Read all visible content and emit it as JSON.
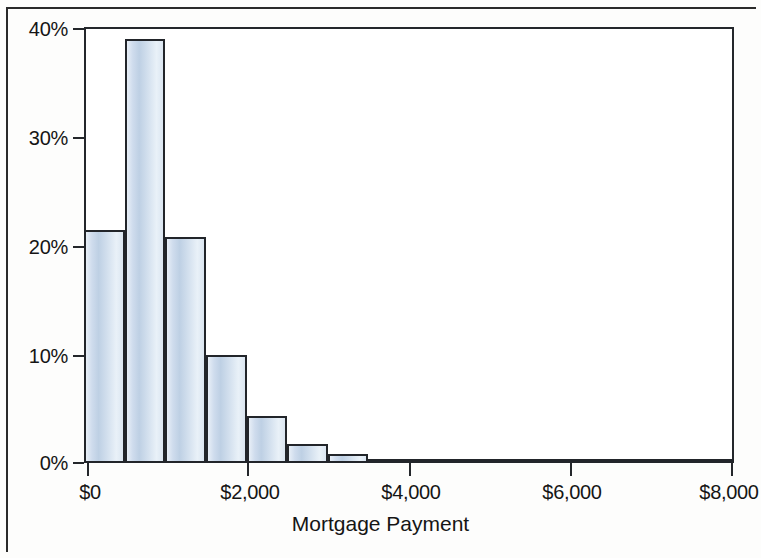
{
  "chart_data": {
    "type": "bar",
    "title": "",
    "subtitle": "",
    "xlabel": "Mortgage Payment",
    "ylabel": "",
    "xlim": [
      0,
      8000
    ],
    "ylim": [
      0,
      40
    ],
    "grid": false,
    "legend": null,
    "x_tick_labels": [
      "$0",
      "$2,000",
      "$4,000",
      "$6,000",
      "$8,000"
    ],
    "x_tick_values": [
      0,
      2000,
      4000,
      6000,
      8000
    ],
    "y_tick_labels": [
      "0%",
      "10%",
      "20%",
      "30%",
      "40%"
    ],
    "y_tick_values": [
      0,
      10,
      20,
      30,
      40
    ],
    "bin_width": 500,
    "bin_starts": [
      0,
      500,
      1000,
      1500,
      2000,
      2500,
      3000,
      3500,
      4000,
      4500,
      5000,
      5500,
      6000,
      6500,
      7000,
      7500
    ],
    "categories": [
      "$0–$500",
      "$500–$1,000",
      "$1,000–$1,500",
      "$1,500–$2,000",
      "$2,000–$2,500",
      "$2,500–$3,000",
      "$3,000–$3,500",
      "$3,500–$4,000",
      "$4,000–$4,500",
      "$4,500–$5,000",
      "$5,000–$5,500",
      "$5,500–$6,000",
      "$6,000–$6,500",
      "$6,500–$7,000",
      "$7,000–$7,500",
      "$7,500–$8,000"
    ],
    "values": [
      21.4,
      38.9,
      20.7,
      9.9,
      4.3,
      1.7,
      0.8,
      0.3,
      0.1,
      0.05,
      0.05,
      0.05,
      0.0,
      0.0,
      0.0,
      0.0
    ],
    "bar_color": "#cfdced",
    "bar_edge_color": "#22252a",
    "axis_color": "#24272b",
    "text_color": "#151515",
    "background_color": "#ffffff"
  },
  "axis": {
    "x_title": "Mortgage Payment"
  }
}
